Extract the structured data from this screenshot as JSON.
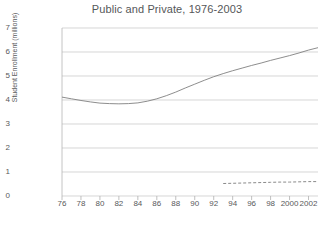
{
  "chart_data": {
    "type": "line",
    "title": "Public and Private, 1976-2003",
    "xlabel": "",
    "ylabel": "Student Enrollment (millions)",
    "xlim": [
      1976,
      2003
    ],
    "ylim": [
      0,
      7
    ],
    "grid": true,
    "legend": "none",
    "y_ticks": [
      7,
      6,
      5,
      4,
      3,
      2,
      1,
      0
    ],
    "x_ticks": [
      "76",
      "78",
      "80",
      "82",
      "84",
      "86",
      "88",
      "90",
      "92",
      "94",
      "96",
      "98",
      "2000",
      "2002"
    ],
    "x_tick_years": [
      1976,
      1978,
      1980,
      1982,
      1984,
      1986,
      1988,
      1990,
      1992,
      1994,
      1996,
      1998,
      2000,
      2002
    ],
    "series": [
      {
        "name": "Public",
        "style": "solid",
        "color": "#808080",
        "x": [
          1976,
          1977,
          1978,
          1979,
          1980,
          1981,
          1982,
          1983,
          1984,
          1985,
          1986,
          1987,
          1988,
          1989,
          1990,
          1991,
          1992,
          1993,
          1994,
          1995,
          1996,
          1997,
          1998,
          1999,
          2000,
          2001,
          2002,
          2003
        ],
        "values": [
          4.12,
          4.05,
          3.98,
          3.92,
          3.87,
          3.85,
          3.84,
          3.85,
          3.88,
          3.95,
          4.05,
          4.18,
          4.33,
          4.5,
          4.66,
          4.82,
          4.97,
          5.1,
          5.22,
          5.33,
          5.44,
          5.54,
          5.65,
          5.75,
          5.85,
          5.96,
          6.08,
          6.18
        ]
      },
      {
        "name": "Private",
        "style": "dashed",
        "color": "#8a8a8a",
        "x": [
          1993,
          1994,
          1995,
          1996,
          1997,
          1998,
          1999,
          2000,
          2001,
          2002,
          2003
        ],
        "values": [
          0.52,
          0.53,
          0.54,
          0.55,
          0.56,
          0.57,
          0.58,
          0.58,
          0.59,
          0.6,
          0.6
        ]
      }
    ]
  }
}
